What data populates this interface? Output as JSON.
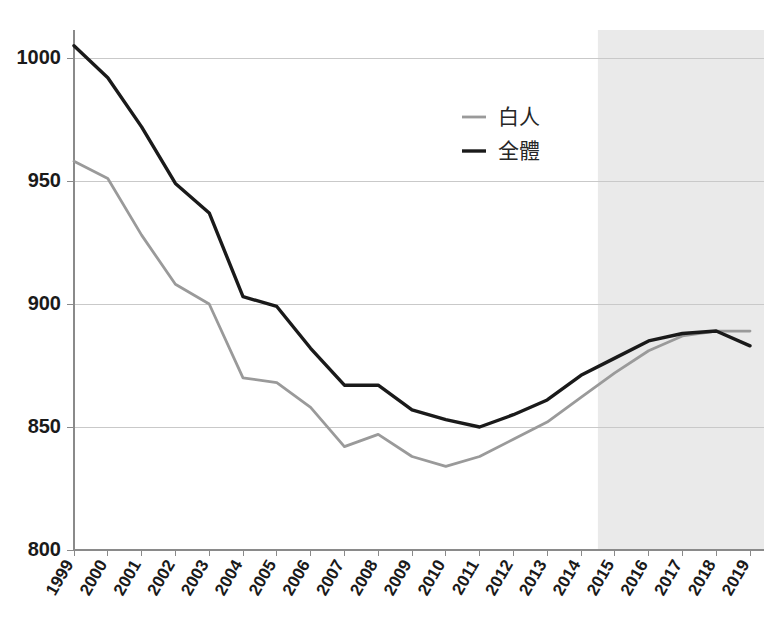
{
  "chart_data": {
    "type": "line",
    "title": "",
    "subtitle": "",
    "xlabel": "",
    "ylabel": "",
    "categories": [
      "1999",
      "2000",
      "2001",
      "2002",
      "2003",
      "2004",
      "2005",
      "2006",
      "2007",
      "2008",
      "2009",
      "2010",
      "2011",
      "2012",
      "2013",
      "2014",
      "2015",
      "2016",
      "2017",
      "2018",
      "2019"
    ],
    "series": [
      {
        "name": "白人",
        "color": "#9a9a9a",
        "values": [
          958,
          951,
          928,
          908,
          900,
          870,
          868,
          858,
          842,
          847,
          838,
          834,
          838,
          845,
          852,
          862,
          872,
          881,
          887,
          889,
          889
        ]
      },
      {
        "name": "全體",
        "color": "#1a1a1a",
        "values": [
          1005,
          992,
          972,
          949,
          937,
          903,
          899,
          882,
          867,
          867,
          857,
          853,
          850,
          855,
          861,
          871,
          878,
          885,
          888,
          889,
          883
        ]
      }
    ],
    "ylim": [
      800,
      1000
    ],
    "yticks": [
      800,
      850,
      900,
      950,
      1000
    ],
    "ytick_labels": [
      "800",
      "850",
      "900",
      "950",
      "1000"
    ],
    "grid": true,
    "legend_position": "upper-right",
    "annotations": [
      {
        "name": "projection-shading",
        "type": "vertical-band",
        "from": "2014.5",
        "to": "2019.5",
        "color": "#e6e6e6"
      }
    ]
  },
  "legend": {
    "entries": [
      {
        "label": "白人",
        "color": "#9a9a9a"
      },
      {
        "label": "全體",
        "color": "#1a1a1a"
      }
    ]
  }
}
